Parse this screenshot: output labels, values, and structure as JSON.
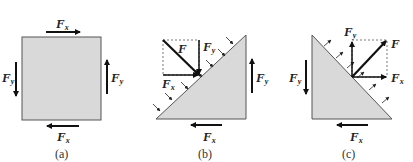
{
  "figure": {
    "colors": {
      "fill": "#d9d9d9",
      "stroke": "#555555",
      "arrow": "#111111",
      "dashed": "#555555"
    },
    "panels": [
      {
        "id": "a",
        "caption": "(a)",
        "shape": "square",
        "labels": {
          "top_fx": {
            "main": "F",
            "sub": "x"
          },
          "bottom_fx": {
            "main": "F",
            "sub": "x"
          },
          "left_fy": {
            "main": "F",
            "sub": "y"
          },
          "right_fy": {
            "main": "F",
            "sub": "y"
          }
        }
      },
      {
        "id": "b",
        "caption": "(b)",
        "shape": "right-triangle-hypotenuse-upper-left",
        "labels": {
          "resultant": {
            "main": "F"
          },
          "component_fy": {
            "main": "F",
            "sub": "y"
          },
          "component_fx": {
            "main": "F",
            "sub": "x"
          },
          "right_fy": {
            "main": "F",
            "sub": "y"
          },
          "bottom_fx": {
            "main": "F",
            "sub": "x"
          }
        }
      },
      {
        "id": "c",
        "caption": "(c)",
        "shape": "right-triangle-hypotenuse-upper-right",
        "labels": {
          "resultant": {
            "main": "F"
          },
          "component_fy": {
            "main": "F",
            "sub": "y"
          },
          "component_fx": {
            "main": "F",
            "sub": "x"
          },
          "left_fy": {
            "main": "F",
            "sub": "y"
          },
          "bottom_fx": {
            "main": "F",
            "sub": "x"
          }
        }
      }
    ]
  }
}
